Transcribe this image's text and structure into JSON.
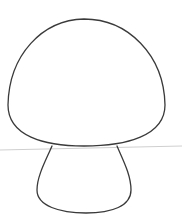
{
  "drawing": {
    "subject": "mushroom outline",
    "colors": {
      "background": "#ffffff",
      "outline": "#3a3a3a",
      "ground_line": "#cfcfcf"
    }
  }
}
